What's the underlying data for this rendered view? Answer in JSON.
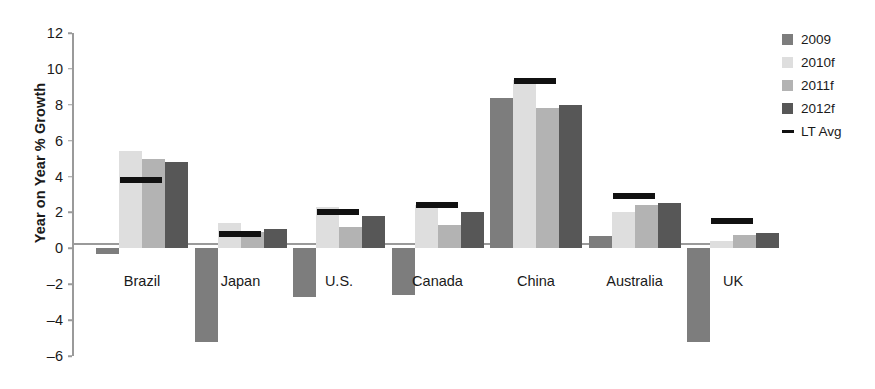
{
  "chart_data": {
    "type": "bar",
    "title": "",
    "xlabel": "",
    "ylabel": "Year on Year % Growth",
    "ylim": [
      -6,
      12
    ],
    "ytick_values": [
      12,
      10,
      8,
      6,
      4,
      2,
      0,
      -2,
      -4,
      -6
    ],
    "ytick_labels": [
      "12",
      "10",
      "8",
      "6",
      "4",
      "2",
      "0",
      "–2",
      "–4",
      "–6"
    ],
    "grid": false,
    "legend_position": "right",
    "categories": [
      "Brazil",
      "Japan",
      "U.S.",
      "Canada",
      "China",
      "Australia",
      "UK"
    ],
    "series": [
      {
        "name": "2009",
        "color": "#7d7d7d",
        "values": [
          -0.3,
          -5.2,
          -2.7,
          -2.6,
          8.4,
          0.7,
          -5.2
        ]
      },
      {
        "name": "2010f",
        "color": "#dedede",
        "values": [
          5.4,
          1.4,
          2.3,
          2.4,
          9.4,
          2.0,
          0.4
        ]
      },
      {
        "name": "2011f",
        "color": "#b3b3b3",
        "values": [
          5.0,
          0.9,
          1.2,
          1.3,
          7.8,
          2.4,
          0.75
        ]
      },
      {
        "name": "2012f",
        "color": "#575757",
        "values": [
          4.8,
          1.05,
          1.8,
          2.0,
          8.0,
          2.5,
          0.85
        ]
      }
    ],
    "lt_avg": {
      "name": "LT Avg",
      "color": "#111111",
      "values": [
        3.8,
        0.8,
        2.0,
        2.4,
        9.3,
        2.9,
        1.5
      ]
    },
    "legend": [
      {
        "label": "2009",
        "color": "#7d7d7d",
        "marker": "square"
      },
      {
        "label": "2010f",
        "color": "#dedede",
        "marker": "square"
      },
      {
        "label": "2011f",
        "color": "#b3b3b3",
        "marker": "square"
      },
      {
        "label": "2012f",
        "color": "#575757",
        "marker": "square"
      },
      {
        "label": "LT Avg",
        "color": "#111111",
        "marker": "line"
      }
    ],
    "axis_color": "#9a9a9a",
    "background": "#ffffff"
  }
}
